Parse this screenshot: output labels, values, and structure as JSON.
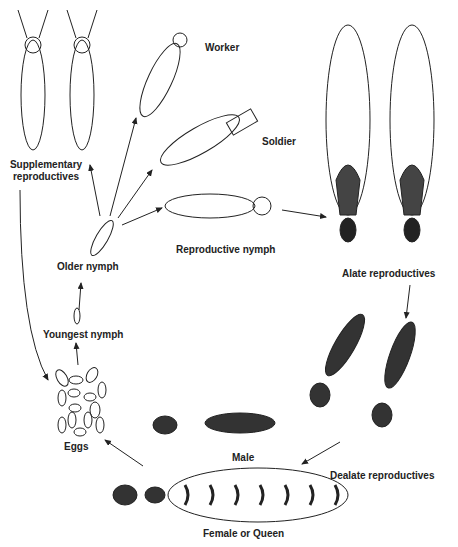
{
  "diagram": {
    "type": "life-cycle",
    "stages": [
      {
        "id": "eggs",
        "label": "Eggs"
      },
      {
        "id": "youngest-nymph",
        "label": "Youngest nymph"
      },
      {
        "id": "older-nymph",
        "label": "Older nymph"
      },
      {
        "id": "worker",
        "label": "Worker"
      },
      {
        "id": "soldier",
        "label": "Soldier"
      },
      {
        "id": "reproductive-nymph",
        "label": "Reproductive nymph"
      },
      {
        "id": "supplementary",
        "label_line1": "Supplementary",
        "label_line2": "reproductives"
      },
      {
        "id": "alate",
        "label": "Alate reproductives"
      },
      {
        "id": "dealate",
        "label": "Dealate reproductives"
      },
      {
        "id": "male",
        "label": "Male"
      },
      {
        "id": "queen",
        "label": "Female or Queen"
      }
    ],
    "arrows": [
      [
        "eggs",
        "youngest-nymph"
      ],
      [
        "youngest-nymph",
        "older-nymph"
      ],
      [
        "older-nymph",
        "supplementary"
      ],
      [
        "older-nymph",
        "worker"
      ],
      [
        "older-nymph",
        "soldier"
      ],
      [
        "older-nymph",
        "reproductive-nymph"
      ],
      [
        "reproductive-nymph",
        "alate"
      ],
      [
        "alate",
        "dealate"
      ],
      [
        "dealate",
        "male-queen"
      ],
      [
        "queen",
        "eggs"
      ],
      [
        "supplementary",
        "eggs"
      ]
    ]
  }
}
